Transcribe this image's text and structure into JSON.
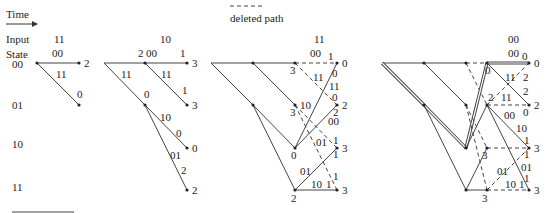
{
  "header": {
    "time_label": "Time",
    "legend_label": "deleted path"
  },
  "row_labels": {
    "input": "Input",
    "state": "State"
  },
  "states": [
    "00",
    "01",
    "10",
    "11"
  ],
  "panels": [
    {
      "input": "11",
      "branch_labels": {
        "top": "00",
        "diag": "11"
      },
      "metrics": {
        "s00": "2",
        "s01": "0"
      }
    },
    {
      "input": "10",
      "branch_labels": {
        "top": "00",
        "top_inc": "1",
        "node_metric_00": "2",
        "diag_a": "11",
        "diag_b": "11",
        "diag_b_inc": "1",
        "node_metric_01": "0",
        "b10": "10",
        "b10_inc": "0",
        "b01": "01",
        "b01_inc": "2"
      },
      "metrics": {
        "s00": "3",
        "s01": "3",
        "s10": "0",
        "s11": "2"
      }
    },
    {
      "input": "11",
      "branch_labels": {
        "top": "00",
        "top_inc": "1",
        "prev_00": "3",
        "d11": "11",
        "d11_inc": "0",
        "u11": "11",
        "u11_inc": "0",
        "prev_01": "3",
        "b10": "10",
        "b00": "00",
        "b00_inc": "1",
        "prev_10": "0",
        "b01": "01",
        "b01_inc": "1",
        "b01b": "01",
        "b01b_inc": "1",
        "prev_11": "2",
        "b10b": "10",
        "b10b_inc": "1",
        "end_inc_2": "2",
        "end_inc_3a": "1"
      },
      "metrics": {
        "s00": "0",
        "s01": "2",
        "s10": "3",
        "s11": "3"
      }
    },
    {
      "input": "00",
      "branch_labels": {
        "top": "00",
        "top_inc": "0",
        "prev_00": "0",
        "d11": "11",
        "d11_inc": "2",
        "d11b_inc": "2",
        "prev_01": "2",
        "u11": "11",
        "u11_inc": "0",
        "b00": "00",
        "b10": "10",
        "b10_inc": "1",
        "b01": "01",
        "b01_inc": "1",
        "prev_10": "3",
        "b01b": "01",
        "prev_11": "3",
        "b10b": "10",
        "b10b_inc": "1",
        "inc_1c": "1"
      },
      "metrics": {
        "s00": "0",
        "s01": "2",
        "s10": "3",
        "s11": "3"
      }
    }
  ]
}
